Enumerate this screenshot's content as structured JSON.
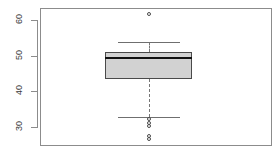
{
  "chart_data": {
    "type": "box",
    "title": "",
    "xlabel": "",
    "ylabel": "",
    "ylim": [
      24.5,
      63.5
    ],
    "grid": false,
    "legend": false,
    "yticks": [
      30,
      40,
      50,
      60
    ],
    "ytick_labels": [
      "30",
      "40",
      "50",
      "60"
    ],
    "categories": [
      "1"
    ],
    "series": [
      {
        "name": "group-1",
        "min_whisker": 32.8,
        "q1": 43.5,
        "median": 49.4,
        "q3": 51.0,
        "max_whisker": 54.0,
        "outliers": [
          61.7,
          32.2,
          31.0,
          30.2,
          27.2,
          26.5
        ]
      }
    ]
  },
  "figure": {
    "background_color": "#ffffff",
    "frame_color": "#8c8c8c",
    "box_fill_color": "#d2d2d2",
    "box_border_color": "#4a4a4a",
    "median_color": "#111111",
    "whisker_color": "#777777",
    "outlier_color": "#4a4a4a",
    "tick_label_color": "#3a3a3a"
  },
  "ticks": [
    {
      "label": "60",
      "value": 60
    },
    {
      "label": "50",
      "value": 50
    },
    {
      "label": "40",
      "value": 40
    },
    {
      "label": "30",
      "value": 30
    }
  ],
  "outliers": [
    {
      "value": 61.7
    },
    {
      "value": 32.2
    },
    {
      "value": 31.0
    },
    {
      "value": 30.2
    },
    {
      "value": 27.2
    },
    {
      "value": 26.5
    }
  ]
}
